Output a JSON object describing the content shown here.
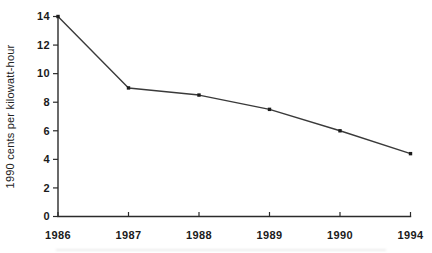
{
  "chart_data": {
    "type": "line",
    "title": "",
    "xlabel": "",
    "ylabel": "1990 cents per kilowatt-hour",
    "categories": [
      "1986",
      "1987",
      "1988",
      "1989",
      "1990",
      "1994"
    ],
    "series": [
      {
        "name": "cost-per-kilowatt-hour",
        "values": [
          14,
          9,
          8.5,
          7.5,
          6,
          4.4
        ]
      }
    ],
    "ylim": [
      0,
      14
    ],
    "yticks": [
      0,
      2,
      4,
      6,
      8,
      10,
      12,
      14
    ],
    "grid": false,
    "legend": "none",
    "marker": "filled-square",
    "colors": {
      "line": "#3a3a3a",
      "marker": "#1c1c1c",
      "axis": "#2b2b2b",
      "text": "#1b1b1b",
      "background": "#ffffff"
    }
  }
}
